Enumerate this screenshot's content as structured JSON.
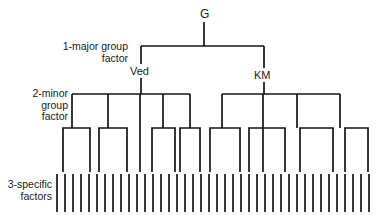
{
  "diagram": {
    "type": "tree",
    "stroke_color": "#141414",
    "background_color": "#ffffff",
    "nodes": {
      "general": "G",
      "major_left": "Ved",
      "major_right": "KM"
    },
    "level_labels": {
      "level1": {
        "line1": "1-major group",
        "line2": "factor"
      },
      "level2": {
        "line1": "2-minor",
        "line2": "group",
        "line3": "factor"
      },
      "level3": {
        "line1": "3-specific",
        "line2": "factors"
      }
    },
    "structure": {
      "levels": 3,
      "root": "G",
      "major_group_factors": [
        "Ved",
        "KM"
      ],
      "minor_group_factors_left": 5,
      "minor_group_factors_right": 4,
      "specific_factor_count": 40
    },
    "geometry": {
      "root_x": 204,
      "root_stem_top": 22,
      "level1_bar_y": 46,
      "level1_left_x": 141,
      "level1_right_x": 264,
      "level2_bar_y": 94,
      "level2_left_bar": [
        72,
        190
      ],
      "level2_right_bar": [
        222,
        340
      ],
      "level2_left_stems": [
        72,
        108,
        140,
        163,
        190
      ],
      "level2_right_stems": [
        222,
        263,
        297,
        340
      ],
      "level3_bar_y": 128,
      "level3_brackets": [
        [
          63,
          90
        ],
        [
          108,
          140
        ],
        [
          152,
          175
        ],
        [
          199,
          229
        ],
        [
          249,
          285
        ],
        [
          300,
          333
        ]
      ],
      "leaf_y_top": 174,
      "leaf_y_bottom": 212,
      "tick_first_x": 57,
      "tick_spacing": 8,
      "tick_count": 40
    }
  }
}
